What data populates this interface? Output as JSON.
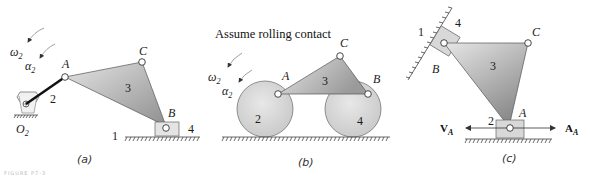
{
  "figure": {
    "panel_a": {
      "caption": "(a)",
      "labels": {
        "omega": "ω",
        "omega_sub": "2",
        "alpha": "α",
        "alpha_sub": "2",
        "A": "A",
        "B": "B",
        "C": "C",
        "O": "O",
        "O_sub": "2",
        "link2": "2",
        "link3": "3",
        "link4": "4",
        "ground": "1"
      }
    },
    "panel_b": {
      "caption": "(b)",
      "title": "Assume rolling contact",
      "labels": {
        "omega": "ω",
        "omega_sub": "2",
        "alpha": "α",
        "alpha_sub": "2",
        "A": "A",
        "B": "B",
        "C": "C",
        "link2": "2",
        "link3": "3",
        "link4": "4"
      }
    },
    "panel_c": {
      "caption": "(c)",
      "labels": {
        "A": "A",
        "B": "B",
        "C": "C",
        "link2": "2",
        "link3": "3",
        "link4": "4",
        "ground": "1",
        "VA": "V",
        "VA_sub": "A",
        "AA": "A",
        "AA_sub": "A"
      }
    },
    "footer": "FIGURE P7-3"
  },
  "colors": {
    "link_fill_light": "#e2e2e2",
    "link_fill_dark": "#9a9a9a",
    "outline": "#555555"
  }
}
